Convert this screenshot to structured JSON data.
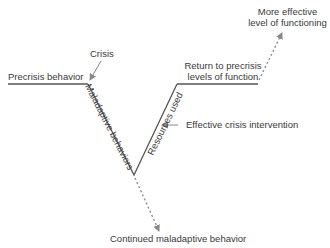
{
  "diagram": {
    "labels": {
      "crisis": "Crisis",
      "precrisis": "Precrisis behavior",
      "maladaptive": "Maladaptive behaviors",
      "resources": "Resources used",
      "intervention": "Effective crisis intervention",
      "return_line1": "Return to precrisis",
      "return_line2": "levels of function",
      "more_line1": "More effective",
      "more_line2": "level of functioning",
      "continued": "Continued maladaptive behavior"
    },
    "colors": {
      "line": "#555555",
      "arrow": "#888888",
      "text": "#3a3a3a"
    }
  }
}
